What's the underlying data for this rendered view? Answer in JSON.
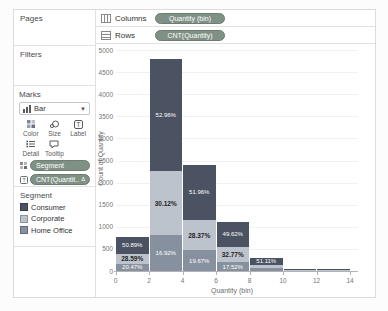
{
  "ui_colors": {
    "pill_bg": "#7f9085",
    "pill_border": "#6c7d72",
    "panel_border": "#e1e1e1"
  },
  "shelves": {
    "columns": {
      "label": "Columns",
      "pill": "Quantity (bin)"
    },
    "rows": {
      "label": "Rows",
      "pill": "CNT(Quantity)"
    }
  },
  "left_panel": {
    "pages_label": "Pages",
    "filters_label": "Filters",
    "marks": {
      "title": "Marks",
      "mark_type": "Bar",
      "buttons": {
        "color": "Color",
        "size": "Size",
        "label": "Label",
        "detail": "Detail",
        "tooltip": "Tooltip"
      },
      "pills": [
        {
          "label": "Segment"
        },
        {
          "label": "CNT(Quantit..",
          "badge": "Δ"
        }
      ]
    },
    "legend": {
      "title": "Segment",
      "items": [
        {
          "label": "Consumer",
          "color": "#4b5261"
        },
        {
          "label": "Corporate",
          "color": "#bdc3cc"
        },
        {
          "label": "Home Office",
          "color": "#87909e"
        }
      ]
    }
  },
  "chart_data": {
    "type": "bar",
    "stacked": true,
    "title": "",
    "xlabel": "Quantity (bin)",
    "ylabel": "Count of Quantity",
    "x_ticks": [
      0,
      2,
      4,
      6,
      8,
      10,
      12,
      14
    ],
    "y_ticks": [
      0,
      500,
      1000,
      1500,
      2000,
      2500,
      3000,
      3500,
      4000,
      4500,
      5000
    ],
    "ylim": [
      0,
      5000
    ],
    "xlim": [
      0,
      14.5
    ],
    "bin_width": 2,
    "stack_order": [
      "Home Office",
      "Corporate",
      "Consumer"
    ],
    "colors": {
      "Consumer": "#4b5261",
      "Corporate": "#bdc3cc",
      "Home Office": "#87909e"
    },
    "bars": [
      {
        "bin_start": 0,
        "segments": {
          "Home Office": 160,
          "Corporate": 223,
          "Consumer": 397
        },
        "labels": {
          "Consumer": "50.89%",
          "Corporate": "28.59%",
          "Home Office": "20.47%"
        }
      },
      {
        "bin_start": 2,
        "segments": {
          "Home Office": 812,
          "Corporate": 1446,
          "Consumer": 2542
        },
        "labels": {
          "Consumer": "52.96%",
          "Corporate": "30.12%",
          "Home Office": "16.92%"
        }
      },
      {
        "bin_start": 4,
        "segments": {
          "Home Office": 472,
          "Corporate": 681,
          "Consumer": 1247
        },
        "labels": {
          "Consumer": "51.96%",
          "Corporate": "28.37%",
          "Home Office": "19.67%"
        }
      },
      {
        "bin_start": 6,
        "segments": {
          "Home Office": 193,
          "Corporate": 360,
          "Consumer": 546
        },
        "labels": {
          "Consumer": "49.62%",
          "Corporate": "32.77%",
          "Home Office": "17.52%"
        }
      },
      {
        "bin_start": 8,
        "segments": {
          "Home Office": 59,
          "Corporate": 87,
          "Consumer": 151
        },
        "labels": {
          "Consumer": "51.11%"
        }
      },
      {
        "bin_start": 10,
        "segments": {
          "Home Office": 15,
          "Corporate": 15,
          "Consumer": 20
        },
        "labels": {}
      },
      {
        "bin_start": 12,
        "segments": {
          "Home Office": 12,
          "Corporate": 13,
          "Consumer": 15
        },
        "labels": {}
      }
    ]
  }
}
